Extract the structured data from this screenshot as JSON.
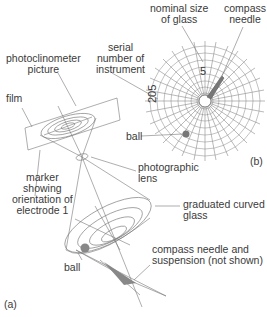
{
  "diagram": {
    "panel_a_label": "(a)",
    "panel_b_label": "(b)",
    "labels": {
      "nominal_size": [
        "nominal size",
        "of glass"
      ],
      "compass_needle": [
        "compass",
        "needle"
      ],
      "serial_number": [
        "serial",
        "number of",
        "instrument"
      ],
      "photoclinometer": [
        "photoclinometer",
        "picture"
      ],
      "film": "film",
      "ball_b": "ball",
      "marker": [
        "marker",
        "showing",
        "orientation of",
        "electrode 1"
      ],
      "photographic_lens": [
        "photographic",
        "lens"
      ],
      "graduated_glass": [
        "graduated curved",
        "glass"
      ],
      "ball_a": "ball",
      "compass_suspension": [
        "compass needle and",
        "suspension (not shown)"
      ]
    },
    "dial_numbers": {
      "top": "5",
      "left": "205"
    },
    "colors": {
      "line": "#777777",
      "grid": "#999999",
      "ball": "#888888",
      "text": "#3a3a3a"
    }
  }
}
